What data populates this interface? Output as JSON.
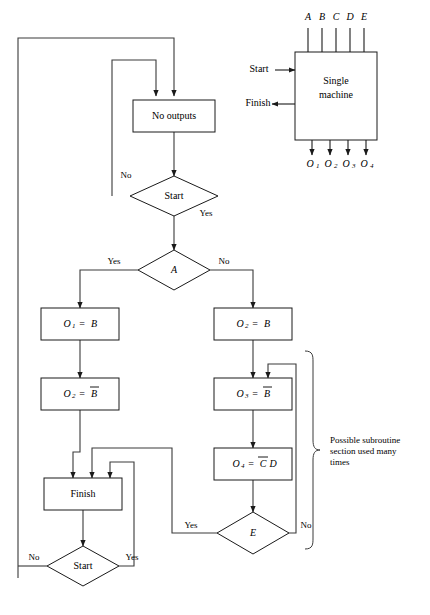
{
  "figure": {
    "block_diagram": {
      "machine_label_line1": "Single",
      "machine_label_line2": "machine",
      "inputs": [
        "A",
        "B",
        "C",
        "D",
        "E"
      ],
      "outputs": [
        "O",
        "O",
        "O",
        "O"
      ],
      "output_subscripts": [
        "1",
        "2",
        "3",
        "4"
      ],
      "start_label": "Start",
      "finish_label": "Finish"
    },
    "flowchart": {
      "nodes": [
        {
          "id": "no-outputs",
          "type": "process",
          "label": "No outputs"
        },
        {
          "id": "start-top",
          "type": "decision",
          "label": "Start"
        },
        {
          "id": "decision-a",
          "type": "decision",
          "label": "A"
        },
        {
          "id": "o1-eq-b",
          "type": "process",
          "label": "O1 = B",
          "out": "O",
          "sub": "1",
          "expr": "B",
          "overline": false
        },
        {
          "id": "o2-eq-b",
          "type": "process",
          "label": "O2 = B",
          "out": "O",
          "sub": "2",
          "expr": "B",
          "overline": false
        },
        {
          "id": "o2-eq-nb",
          "type": "process",
          "label": "O2 = B-bar",
          "out": "O",
          "sub": "2",
          "expr": "B",
          "overline": true
        },
        {
          "id": "o3-eq-nb",
          "type": "process",
          "label": "O3 = B-bar",
          "out": "O",
          "sub": "3",
          "expr": "B",
          "overline": true
        },
        {
          "id": "o4-eq-ncd",
          "type": "process",
          "label": "O4 = C-bar D",
          "out": "O",
          "sub": "4",
          "expr_a": "C",
          "expr_b": "D",
          "overline": true
        },
        {
          "id": "finish",
          "type": "process",
          "label": "Finish"
        },
        {
          "id": "decision-e",
          "type": "decision",
          "label": "E"
        },
        {
          "id": "start-bottom",
          "type": "decision",
          "label": "Start"
        }
      ],
      "edge_labels": {
        "start_top_no": "No",
        "start_top_yes": "Yes",
        "a_yes": "Yes",
        "a_no": "No",
        "e_yes": "Yes",
        "e_no": "No",
        "start_bottom_no": "No",
        "start_bottom_yes": "Yes"
      },
      "annotation": {
        "line1": "Possible subroutine",
        "line2": "section used many",
        "line3": "times"
      }
    },
    "colors": {
      "stroke": "#1a1a1a",
      "connector": "#3a3a3a",
      "background": "#ffffff",
      "text": "#000000"
    }
  }
}
